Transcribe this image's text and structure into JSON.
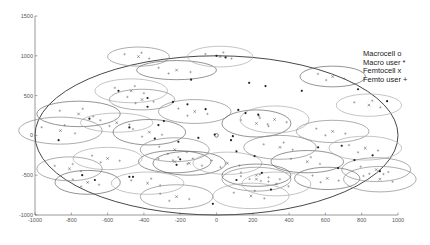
{
  "chart_data": {
    "type": "scatter",
    "title": "",
    "xlabel": "",
    "ylabel": "",
    "xlim": [
      -1000,
      1000
    ],
    "ylim": [
      -1000,
      1500
    ],
    "xticks": [
      -1000,
      -800,
      -600,
      -400,
      -200,
      0,
      200,
      400,
      600,
      800,
      1000
    ],
    "yticks": [
      -1000,
      -500,
      0,
      500,
      1000,
      1500
    ],
    "grid": false,
    "legend": {
      "position": "upper-right",
      "entries": [
        {
          "label": "Macrocell",
          "marker": "o"
        },
        {
          "label": "Macro user",
          "marker": "*"
        },
        {
          "label": "Femtocell",
          "marker": "x"
        },
        {
          "label": "Femto user",
          "marker": "+"
        }
      ]
    },
    "macrocell": {
      "x": 0,
      "y": 0,
      "coverage_radius": 1000
    },
    "femtocells": [
      {
        "x": -430,
        "y": 990,
        "rx": 170,
        "ry": 120
      },
      {
        "x": -220,
        "y": 820,
        "rx": 220,
        "ry": 120
      },
      {
        "x": -470,
        "y": 560,
        "rx": 200,
        "ry": 150
      },
      {
        "x": -410,
        "y": 450,
        "rx": 180,
        "ry": 130
      },
      {
        "x": -760,
        "y": 270,
        "rx": 230,
        "ry": 160
      },
      {
        "x": -550,
        "y": 160,
        "rx": 200,
        "ry": 120
      },
      {
        "x": -860,
        "y": 60,
        "rx": 230,
        "ry": 170
      },
      {
        "x": -370,
        "y": 40,
        "rx": 200,
        "ry": 160
      },
      {
        "x": 20,
        "y": 990,
        "rx": 180,
        "ry": 130
      },
      {
        "x": -120,
        "y": 300,
        "rx": 200,
        "ry": 150
      },
      {
        "x": 220,
        "y": 150,
        "rx": 190,
        "ry": 170
      },
      {
        "x": 320,
        "y": 200,
        "rx": 190,
        "ry": 170
      },
      {
        "x": 350,
        "y": -150,
        "rx": 200,
        "ry": 150
      },
      {
        "x": 640,
        "y": 740,
        "rx": 180,
        "ry": 130
      },
      {
        "x": 840,
        "y": 380,
        "rx": 180,
        "ry": 140
      },
      {
        "x": 640,
        "y": 50,
        "rx": 200,
        "ry": 140
      },
      {
        "x": -230,
        "y": -330,
        "rx": 200,
        "ry": 140
      },
      {
        "x": -600,
        "y": -290,
        "rx": 190,
        "ry": 140
      },
      {
        "x": -810,
        "y": -420,
        "rx": 180,
        "ry": 150
      },
      {
        "x": -710,
        "y": -590,
        "rx": 180,
        "ry": 150
      },
      {
        "x": -380,
        "y": -600,
        "rx": 200,
        "ry": 140
      },
      {
        "x": -230,
        "y": -180,
        "rx": 190,
        "ry": 150
      },
      {
        "x": -150,
        "y": -350,
        "rx": 200,
        "ry": 150
      },
      {
        "x": 60,
        "y": -350,
        "rx": 190,
        "ry": 140
      },
      {
        "x": 220,
        "y": -550,
        "rx": 190,
        "ry": 150
      },
      {
        "x": 220,
        "y": -500,
        "rx": 190,
        "ry": 140
      },
      {
        "x": 190,
        "y": -760,
        "rx": 210,
        "ry": 160
      },
      {
        "x": -220,
        "y": -770,
        "rx": 200,
        "ry": 150
      },
      {
        "x": 500,
        "y": -330,
        "rx": 200,
        "ry": 140
      },
      {
        "x": 820,
        "y": -160,
        "rx": 200,
        "ry": 150
      },
      {
        "x": 900,
        "y": -550,
        "rx": 200,
        "ry": 160
      },
      {
        "x": 610,
        "y": -540,
        "rx": 180,
        "ry": 140
      },
      {
        "x": 330,
        "y": -610,
        "rx": 190,
        "ry": 150
      },
      {
        "x": 880,
        "y": -430,
        "rx": 190,
        "ry": 150
      }
    ],
    "macro_users": [
      {
        "x": 0,
        "y": 1000
      },
      {
        "x": 50,
        "y": 980
      },
      {
        "x": -540,
        "y": 560
      },
      {
        "x": -380,
        "y": 470
      },
      {
        "x": -380,
        "y": 360
      },
      {
        "x": -480,
        "y": 100
      },
      {
        "x": -870,
        "y": -60
      },
      {
        "x": -700,
        "y": 210
      },
      {
        "x": -140,
        "y": 700
      },
      {
        "x": 180,
        "y": 660
      },
      {
        "x": 270,
        "y": 620
      },
      {
        "x": 470,
        "y": 560
      },
      {
        "x": -240,
        "y": 420
      },
      {
        "x": -160,
        "y": 390
      },
      {
        "x": -60,
        "y": 330
      },
      {
        "x": 120,
        "y": 320
      },
      {
        "x": 160,
        "y": 280
      },
      {
        "x": 230,
        "y": 260
      },
      {
        "x": -290,
        "y": 180
      },
      {
        "x": -320,
        "y": 130
      },
      {
        "x": 780,
        "y": 580
      },
      {
        "x": 940,
        "y": 430
      },
      {
        "x": -100,
        "y": -30
      },
      {
        "x": 80,
        "y": -60
      },
      {
        "x": -10,
        "y": 10
      },
      {
        "x": 90,
        "y": -10
      },
      {
        "x": -340,
        "y": -40
      },
      {
        "x": -210,
        "y": -80
      },
      {
        "x": 110,
        "y": -200
      },
      {
        "x": 210,
        "y": -260
      },
      {
        "x": 560,
        "y": -150
      },
      {
        "x": 690,
        "y": -130
      },
      {
        "x": 760,
        "y": -310
      },
      {
        "x": 670,
        "y": -410
      },
      {
        "x": 860,
        "y": -250
      },
      {
        "x": 900,
        "y": -450
      },
      {
        "x": -740,
        "y": -500
      },
      {
        "x": -670,
        "y": -560
      },
      {
        "x": -460,
        "y": -520
      },
      {
        "x": -480,
        "y": -520
      },
      {
        "x": -220,
        "y": -370
      },
      {
        "x": -200,
        "y": -300
      },
      {
        "x": 110,
        "y": -560
      },
      {
        "x": 250,
        "y": -470
      },
      {
        "x": -20,
        "y": -860
      },
      {
        "x": 300,
        "y": -680
      }
    ]
  },
  "legend_labels": {
    "macrocell": "Macrocell  o",
    "macro_user": "Macro user *",
    "femtocell": "Femtocell  x",
    "femto_user": "Femto user +"
  },
  "axes": {
    "x_ticks_labels": [
      "-1000",
      "-800",
      "-600",
      "-400",
      "-200",
      "0",
      "200",
      "400",
      "600",
      "800",
      "1000"
    ],
    "y_ticks_labels": [
      "-1000",
      "-500",
      "0",
      "500",
      "1000",
      "1500"
    ]
  }
}
